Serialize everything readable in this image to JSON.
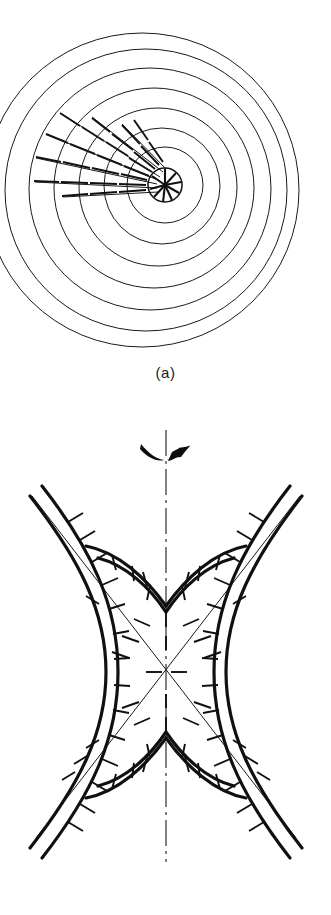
{
  "figure": {
    "background_color": "#ffffff",
    "ink_color": "#101010",
    "panels": [
      {
        "id": "a",
        "caption": "(a)",
        "kind": "concentric-circular-field-lines",
        "description": "Nested circular field lines about a central hub with radial hatch ticks in the upper-left sector",
        "center": {
          "x": 165,
          "y": 185
        },
        "hub": {
          "name": "central-hub",
          "radius": 17,
          "spoke_count": 9,
          "spoke_inner_radius": 2,
          "spoke_outer_radius": 16
        },
        "rings": [
          {
            "index": 1,
            "cx": 165,
            "cy": 185,
            "r": 38
          },
          {
            "index": 2,
            "cx": 162,
            "cy": 186,
            "r": 58
          },
          {
            "index": 3,
            "cx": 158,
            "cy": 187,
            "r": 79
          },
          {
            "index": 4,
            "cx": 154,
            "cy": 188,
            "r": 100
          },
          {
            "index": 5,
            "cx": 150,
            "cy": 189,
            "r": 121
          },
          {
            "index": 6,
            "cx": 146,
            "cy": 190,
            "r": 141
          },
          {
            "index": 7,
            "cx": 142,
            "cy": 190,
            "r": 157
          }
        ],
        "hatch": {
          "name": "radial-hatch-ticks",
          "sector_start_deg": 150,
          "sector_end_deg": 205,
          "ray_count": 8,
          "note": "short radial dashes crossing each ring in the left/upper-left sector"
        }
      },
      {
        "id": "b",
        "caption": "(b)",
        "kind": "hyperbolic-field-lines",
        "description": "Family of hyperbolae with crossing asymptotes, hatch ticks, vertical dash-dot symmetry axis and a curved direction arrow",
        "center": {
          "x": 166,
          "y": 272
        },
        "symmetry_axis": {
          "name": "vertical-dash-dot-axis",
          "x": 166,
          "y_top": 30,
          "y_bottom": 462,
          "style": "dash-dot"
        },
        "direction_arrow": {
          "name": "curved-direction-arrow",
          "x": 166,
          "y": 48,
          "points": "up-right"
        },
        "asymptotes": [
          {
            "name": "asymptote-nw-se",
            "x1": 36,
            "y1": 438,
            "x2": 300,
            "y2": 96
          },
          {
            "name": "asymptote-ne-sw",
            "x1": 296,
            "y1": 438,
            "x2": 32,
            "y2": 96
          }
        ],
        "hyperbola_families": [
          {
            "orientation": "vertical",
            "branches": [
              "upper",
              "lower"
            ],
            "count": 2,
            "weight": "thick",
            "note": "inner pair opening up and down about the centre, drawn heavy"
          },
          {
            "orientation": "horizontal",
            "branches": [
              "left",
              "right"
            ],
            "count": 4,
            "weight": "thick",
            "note": "outer pairs opening left and right, drawn heavy"
          }
        ],
        "hatch": {
          "name": "perpendicular-hatch-ticks",
          "note": "short ticks set perpendicular to each hyperbola and along the asymptotes"
        }
      }
    ]
  }
}
